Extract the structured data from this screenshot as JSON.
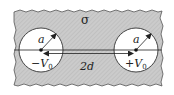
{
  "diagram": {
    "medium": {
      "label": "σ",
      "fill": "#c8c8c8",
      "description": "conducting medium with conductivity sigma"
    },
    "electrodes": [
      {
        "name": "left-electrode",
        "radius_label": "a",
        "potential_sign": "−",
        "potential_symbol": "V",
        "potential_subscript": "0"
      },
      {
        "name": "right-electrode",
        "radius_label": "a",
        "potential_sign": "+",
        "potential_symbol": "V",
        "potential_subscript": "0"
      }
    ],
    "separation": {
      "label": "2d"
    },
    "colors": {
      "medium": "#c8c8c8",
      "hatch": "#b0b0b0",
      "line": "#222222",
      "circle_fill": "#ffffff"
    }
  }
}
